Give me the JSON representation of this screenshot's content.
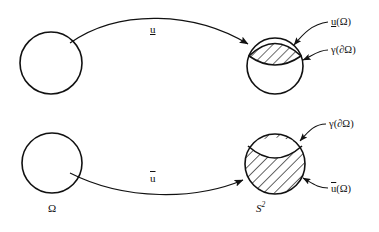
{
  "figure": {
    "background_color": "#ffffff",
    "stroke_color": "#111111",
    "hatch_color": "#111111"
  },
  "rows": [
    {
      "id": "row-upper",
      "map_label": "u",
      "map_label_style": "underline",
      "source": {
        "name": "omega-circle-upper",
        "label": "",
        "cx": 51,
        "cy": 63,
        "r": 31,
        "fill": "none"
      },
      "target": {
        "name": "sphere-circle-upper",
        "cx": 275,
        "cy": 66,
        "r": 28,
        "fill": "none",
        "region": "hatched-cap-top-small",
        "region_description": "small hatched lens-shaped cap at top of sphere"
      },
      "annotations": [
        {
          "name": "annotation-image-of-omega-upper",
          "text_plain": "u(Ω)",
          "u_style": "underline",
          "text_prefix": "u",
          "text_suffix": "(Ω)",
          "x": 331,
          "y": 17
        },
        {
          "name": "annotation-gamma-boundary-upper",
          "text_plain": "γ(∂Ω)",
          "u_style": "none",
          "text_prefix": "",
          "text_suffix": "γ(∂Ω)",
          "x": 331,
          "y": 45
        }
      ]
    },
    {
      "id": "row-lower",
      "map_label": "u",
      "map_label_style": "overline",
      "source": {
        "name": "omega-circle-lower",
        "label": "Ω",
        "cx": 52,
        "cy": 163,
        "r": 30,
        "fill": "none"
      },
      "target": {
        "name": "sphere-circle-lower",
        "cx": 275,
        "cy": 164,
        "r": 30,
        "fill": "none",
        "region": "hatched-all-except-top-cap",
        "region_description": "entire sphere hatched except a small white lens-shaped cap at top"
      },
      "annotations": [
        {
          "name": "annotation-gamma-boundary-lower",
          "text_plain": "γ(∂Ω)",
          "u_style": "none",
          "text_prefix": "",
          "text_suffix": "γ(∂Ω)",
          "x": 329,
          "y": 119
        },
        {
          "name": "annotation-image-of-omega-lower",
          "text_plain": "u(Ω)",
          "u_style": "overline",
          "text_prefix": "u",
          "text_suffix": "(Ω)",
          "x": 331,
          "y": 184
        }
      ]
    }
  ],
  "space_labels": [
    {
      "name": "domain-label-omega",
      "text": "Ω",
      "x": 48,
      "y": 203
    },
    {
      "name": "codomain-label-s2",
      "text_base": "S",
      "text_exponent": "2",
      "x": 256,
      "y": 201
    }
  ],
  "map_labels": [
    {
      "name": "map-arrow-label-u-underline",
      "text": "u",
      "style": "underline",
      "x": 150,
      "y": 24
    },
    {
      "name": "map-arrow-label-u-overline",
      "text": "u",
      "style": "overline",
      "x": 150,
      "y": 173
    }
  ]
}
